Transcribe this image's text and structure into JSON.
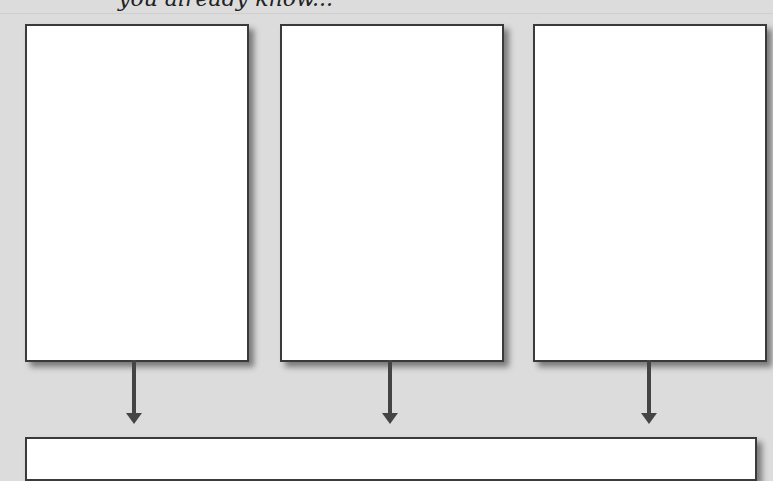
{
  "caption": "you already know...",
  "boxes": [
    {
      "label": ""
    },
    {
      "label": ""
    },
    {
      "label": ""
    }
  ],
  "result_box": {
    "label": ""
  },
  "colors": {
    "background": "#dcdcdc",
    "box_fill": "#ffffff",
    "stroke": "#3a3a3a"
  }
}
